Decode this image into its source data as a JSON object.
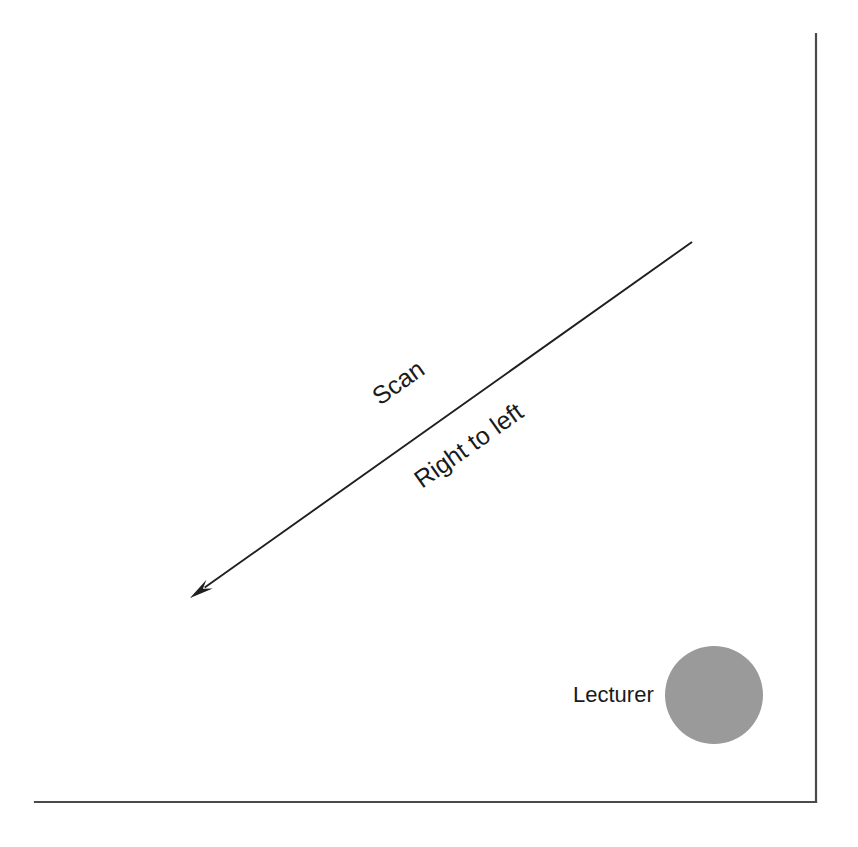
{
  "diagram": {
    "background_color": "#ffffff",
    "width": 858,
    "height": 847,
    "labels": {
      "scan": "Scan",
      "direction": "Right to left",
      "lecturer": "Lecturer"
    },
    "walls": {
      "name": "room-corner",
      "color": "#4a4a4a",
      "stroke_width": 2.2,
      "right_wall": {
        "x1": 816,
        "y1": 34,
        "x2": 816,
        "y2": 802
      },
      "floor": {
        "x1": 35,
        "y1": 802,
        "x2": 816,
        "y2": 802
      }
    },
    "scan_arrow": {
      "name": "scan-direction-arrow",
      "color": "#1f1f1f",
      "stroke_width": 1.9,
      "start_x": 692,
      "start_y": 242,
      "end_x": 190,
      "end_y": 598,
      "angle_deg": -35.4,
      "arrowhead_length": 24,
      "arrowhead_width": 11
    },
    "lecturer_marker": {
      "name": "lecturer-circle",
      "fill_color": "#9a9a9a",
      "center_x": 714,
      "center_y": 695,
      "radius": 49
    },
    "text_placement": {
      "scan": {
        "x": 380,
        "y": 406,
        "rotation": -35.4
      },
      "direction": {
        "x": 422,
        "y": 489,
        "rotation": -35.4
      },
      "lecturer": {
        "x": 573,
        "y": 702,
        "rotation": 0
      }
    }
  }
}
